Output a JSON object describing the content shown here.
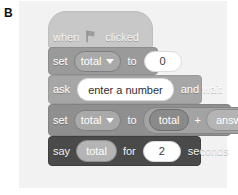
{
  "panel": {
    "label": "B"
  },
  "script": {
    "blocks": [
      {
        "type": "hat",
        "name": "when-flag-clicked",
        "words": {
          "pre": "when",
          "post": "clicked"
        },
        "icon": "green-flag-icon"
      },
      {
        "type": "stack",
        "name": "set-variable-to",
        "words": {
          "verb": "set",
          "to": "to"
        },
        "variable": "total",
        "value": "0"
      },
      {
        "type": "stack",
        "name": "ask-and-wait",
        "words": {
          "verb": "ask",
          "suffix": "and wait"
        },
        "prompt": "enter a number"
      },
      {
        "type": "stack",
        "name": "set-variable-to-sum",
        "words": {
          "verb": "set",
          "to": "to"
        },
        "variable": "total",
        "operand_left": "total",
        "operator": "+",
        "operand_right": "answer"
      },
      {
        "type": "stack",
        "name": "say-for-seconds",
        "words": {
          "verb": "say",
          "for": "for",
          "unit": "seconds"
        },
        "reporter": "total",
        "duration": "2"
      }
    ]
  },
  "colors": {
    "panel_bg": "#f2f2f2",
    "hat_block": "#c8c8c8",
    "set_block": "#9a9a9a",
    "ask_block": "#a6a6a6",
    "set_sum_block": "#8f8f8f",
    "say_block": "#4a4a4a",
    "input_white": "#ffffff",
    "flag": "#9e9e9e"
  }
}
